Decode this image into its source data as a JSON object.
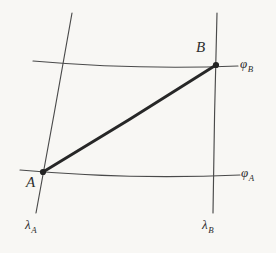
{
  "figure": {
    "background_color": "#f8f7f4",
    "ink_color": "#3a3a3a",
    "geodesic_color": "#272727",
    "points": [
      {
        "id": "A",
        "label": "A",
        "x": 43,
        "y": 172,
        "marker": "filled-dot"
      },
      {
        "id": "B",
        "label": "B",
        "x": 216,
        "y": 65,
        "marker": "filled-dot"
      }
    ],
    "parallels": [
      {
        "id": "phi_B",
        "label_base": "φ",
        "label_sub": "B",
        "description": "upper parallel of latitude through B",
        "x_start": 33,
        "y_start": 61,
        "x_end": 238,
        "y_end": 66
      },
      {
        "id": "phi_A",
        "label_base": "φ",
        "label_sub": "A",
        "description": "lower parallel of latitude through A",
        "x_start": 20,
        "y_start": 170,
        "x_end": 240,
        "y_end": 175
      }
    ],
    "meridians": [
      {
        "id": "lambda_A",
        "label_base": "λ",
        "label_sub": "A",
        "description": "meridian of longitude through A",
        "x_start": 72,
        "y_start": 13,
        "x_end": 36,
        "y_end": 213
      },
      {
        "id": "lambda_B",
        "label_base": "λ",
        "label_sub": "B",
        "description": "meridian of longitude through B",
        "x_start": 217,
        "y_start": 13,
        "x_end": 213,
        "y_end": 213
      }
    ],
    "geodesic": {
      "id": "geodesic-AB",
      "from": "A",
      "to": "B",
      "description": "thick line joining A and B",
      "stroke_width": 2.8
    }
  },
  "labels": {
    "point_A": "A",
    "point_B": "B",
    "phi_base": "φ",
    "lambda_base": "λ",
    "sub_A": "A",
    "sub_B": "B"
  }
}
